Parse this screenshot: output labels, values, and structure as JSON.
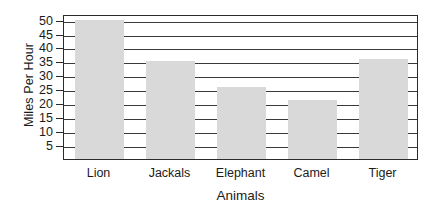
{
  "chart_data": {
    "type": "bar",
    "title": "",
    "xlabel": "Animals",
    "ylabel": "Miles Per Hour",
    "categories": [
      "Lion",
      "Jackals",
      "Elephant",
      "Camel",
      "Tiger"
    ],
    "values": [
      50,
      35,
      26,
      21,
      36
    ],
    "ylim": [
      0,
      52
    ],
    "yticks": [
      5,
      10,
      15,
      20,
      25,
      30,
      35,
      40,
      45,
      50
    ],
    "ytick_labels": [
      "5",
      "10",
      "15",
      "20",
      "25",
      "30",
      "35",
      "40",
      "45",
      "50"
    ],
    "grid": true,
    "grid_axis": "y",
    "legend": false,
    "bar_color": "#d9d9d9",
    "axis_color": "#2b2b2b",
    "grid_color": "#3a3a3a",
    "background_color": "#ffffff"
  }
}
